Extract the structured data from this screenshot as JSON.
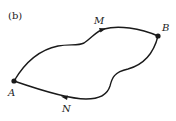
{
  "figure": {
    "panel_label": "(b)",
    "points": [
      {
        "name": "A",
        "x": 14,
        "y": 81
      },
      {
        "name": "B",
        "x": 158,
        "y": 36
      }
    ],
    "path_labels": [
      {
        "name": "M",
        "x": 96,
        "y": 25
      },
      {
        "name": "N",
        "x": 63,
        "y": 111
      }
    ],
    "stroke_color": "#1a1a1a"
  }
}
